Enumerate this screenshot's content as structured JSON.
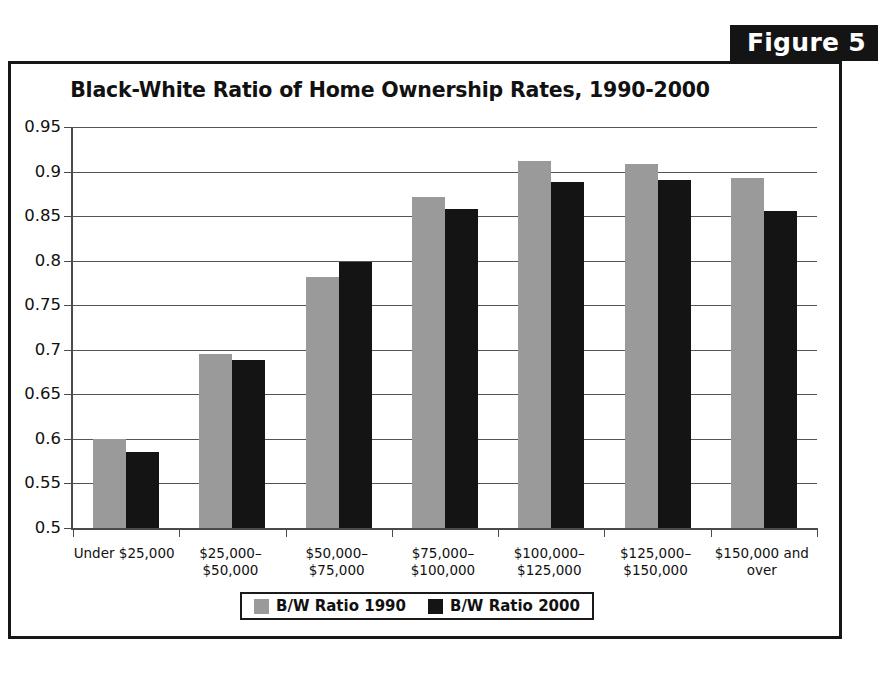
{
  "figure_tab": {
    "label": "Figure 5"
  },
  "chart_data": {
    "type": "bar",
    "title": "Black-White Ratio of Home Ownership Rates, 1990-2000",
    "xlabel": "",
    "ylabel": "",
    "ylim": [
      0.5,
      0.95
    ],
    "ytick_step": 0.05,
    "yticks": [
      "0.95",
      "0.9",
      "0.85",
      "0.8",
      "0.75",
      "0.7",
      "0.65",
      "0.6",
      "0.55",
      "0.5"
    ],
    "ytick_values": [
      0.95,
      0.9,
      0.85,
      0.8,
      0.75,
      0.7,
      0.65,
      0.6,
      0.55,
      0.5
    ],
    "grid": true,
    "legend_position": "bottom",
    "categories": [
      "Under $25,000",
      "$25,000–$50,000",
      "$50,000–$75,000",
      "$75,000–\n$100,000",
      "$100,000–\n$125,000",
      "$125,000–\n$150,000",
      "$150,000 and over"
    ],
    "series": [
      {
        "name": "B/W Ratio 1990",
        "color": "#9a9a9a",
        "values": [
          0.6,
          0.695,
          0.782,
          0.871,
          0.912,
          0.909,
          0.893
        ]
      },
      {
        "name": "B/W Ratio 2000",
        "color": "#141414",
        "values": [
          0.585,
          0.689,
          0.798,
          0.858,
          0.888,
          0.891,
          0.856
        ]
      }
    ]
  },
  "legend": {
    "items": [
      {
        "label": "B/W Ratio 1990",
        "color": "#9a9a9a"
      },
      {
        "label": "B/W Ratio 2000",
        "color": "#141414"
      }
    ]
  },
  "colors": {
    "series_1990": "#9a9a9a",
    "series_2000": "#141414",
    "frame": "#161616",
    "axis": "#4a4a4a",
    "grid": "#555555",
    "text": "#111111",
    "background": "#ffffff"
  }
}
